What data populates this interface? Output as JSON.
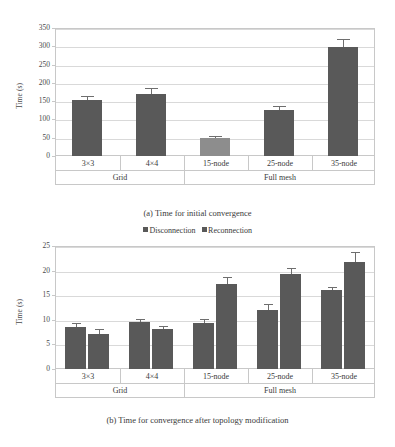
{
  "figure": {
    "legend": {
      "entries": [
        {
          "label": "Disconnection",
          "color": "#595959"
        },
        {
          "label": "Reconnection",
          "color": "#595959"
        }
      ]
    },
    "captions": {
      "a": "(a) Time for initial convergence",
      "b": "(b) Time for convergence after topology modification"
    },
    "groups": [
      "Grid",
      "Full mesh"
    ]
  },
  "chart_data": [
    {
      "type": "bar",
      "id": "a",
      "title": "(a) Time for initial convergence",
      "xlabel": "",
      "ylabel": "Time (s)",
      "ylim": [
        0,
        350
      ],
      "yticks": [
        0,
        50,
        100,
        150,
        200,
        250,
        300,
        350
      ],
      "ytick_labels": [
        "0",
        "50",
        "100",
        "150",
        "200",
        "250",
        "300",
        "350"
      ],
      "grid": true,
      "legend_position": "none",
      "categories": [
        "3×3",
        "4×4",
        "15-node",
        "25-node",
        "35-node"
      ],
      "category_groups": [
        {
          "label": "Grid",
          "categories": [
            "3×3",
            "4×4"
          ]
        },
        {
          "label": "Full mesh",
          "categories": [
            "15-node",
            "25-node",
            "35-node"
          ]
        }
      ],
      "values": [
        152,
        169,
        50,
        127,
        299
      ],
      "errors": [
        13,
        16,
        4,
        9,
        20
      ],
      "bar_colors": [
        "#595959",
        "#595959",
        "#8d8d8d",
        "#595959",
        "#595959"
      ]
    },
    {
      "type": "bar",
      "id": "b",
      "title": "(b) Time for convergence after topology modification",
      "xlabel": "",
      "ylabel": "Time (s)",
      "ylim": [
        0,
        25
      ],
      "yticks": [
        0,
        5,
        10,
        15,
        20,
        25
      ],
      "ytick_labels": [
        "0",
        "5",
        "10",
        "15",
        "20",
        "25"
      ],
      "grid": true,
      "legend_position": "top",
      "categories": [
        "3×3",
        "4×4",
        "15-node",
        "25-node",
        "35-node"
      ],
      "category_groups": [
        {
          "label": "Grid",
          "categories": [
            "3×3",
            "4×4"
          ]
        },
        {
          "label": "Full mesh",
          "categories": [
            "15-node",
            "25-node",
            "35-node"
          ]
        }
      ],
      "series": [
        {
          "name": "Disconnection",
          "color": "#595959",
          "values": [
            8.6,
            9.5,
            9.3,
            12.0,
            16.0
          ],
          "errors": [
            0.7,
            0.6,
            0.8,
            1.2,
            0.6
          ]
        },
        {
          "name": "Reconnection",
          "color": "#595959",
          "values": [
            7.2,
            8.2,
            17.2,
            19.3,
            21.7
          ],
          "errors": [
            0.9,
            0.5,
            1.4,
            1.3,
            2.0
          ]
        }
      ]
    }
  ]
}
